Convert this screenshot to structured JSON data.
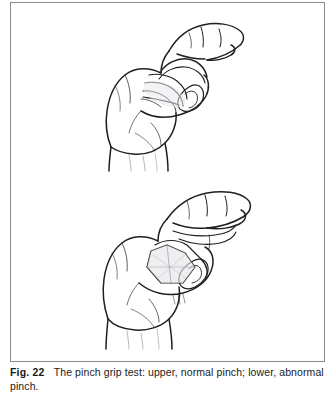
{
  "figure": {
    "label": "Fig. 22",
    "caption_text": "The pinch grip test: upper, normal pinch; lower, abnormal pinch.",
    "frame_color": "#8a8a8a",
    "background_color": "#ffffff",
    "ink_color": "#1a1a1a"
  },
  "illustrations": [
    {
      "id": "upper",
      "name": "normal-pinch-hand-drawing",
      "alt": "Line drawing of a right hand performing a normal pinch grip: thumb and index finger form a rounded O shape, tips touching"
    },
    {
      "id": "lower",
      "name": "abnormal-pinch-hand-drawing",
      "alt": "Line drawing of a right hand performing an abnormal pinch grip: thumb and index finger form a collapsed angular shape with hyperextended joints"
    }
  ]
}
